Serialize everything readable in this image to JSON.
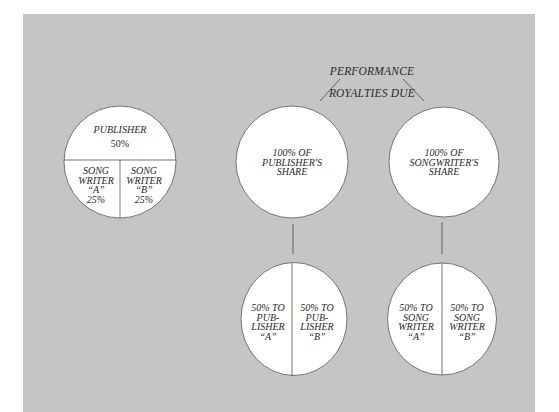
{
  "colors": {
    "background": "#c5c5c5",
    "circle_fill": "#ffffff",
    "stroke": "#555555",
    "text": "#2a2a2a"
  },
  "title": {
    "line1": "PERFORMANCE",
    "line2": "ROYALTIES DUE"
  },
  "split_circle": {
    "top_label": "PUBLISHER",
    "top_value": "50%",
    "left_label": "SONG\nWRITER\n“A”\n25%",
    "right_label": "SONG\nWRITER\n“B”\n25%"
  },
  "publisher_share": {
    "label": "100% OF\nPUBLISHER'S\nSHARE",
    "split_left": "50% TO\nPUB-\nLISHER\n“A”",
    "split_right": "50% TO\nPUB-\nLISHER\n“B”"
  },
  "songwriter_share": {
    "label": "100% OF\nSONGWRITER'S\nSHARE",
    "split_left": "50% TO\nSONG\nWRITER\n“A”",
    "split_right": "50% TO\nSONG\nWRITER\n“B”"
  }
}
